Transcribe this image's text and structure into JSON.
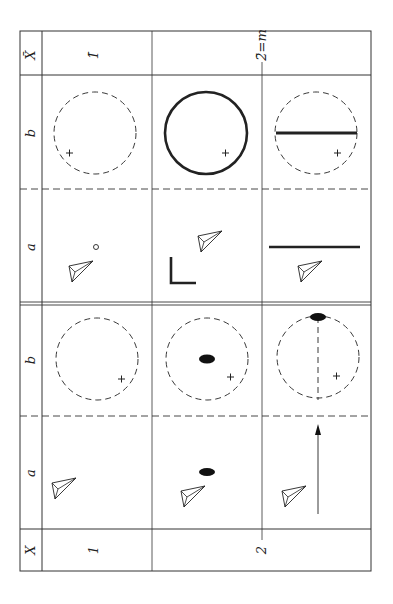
{
  "figure": {
    "upper_section": {
      "row_header": "X̄",
      "col_labels": [
        "1̄",
        "2̄=m"
      ],
      "sub_rows": [
        "b",
        "a"
      ]
    },
    "lower_section": {
      "row_header": "X",
      "col_labels": [
        "1",
        "2"
      ],
      "sub_rows": [
        "b",
        "a"
      ]
    },
    "colors": {
      "ink": "#1a1a1a",
      "background": "#ffffff"
    }
  }
}
